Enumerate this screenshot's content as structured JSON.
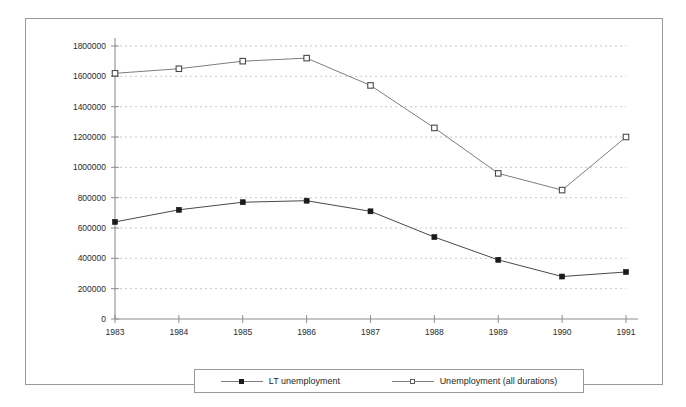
{
  "chart_data": {
    "type": "line",
    "title": "",
    "xlabel": "",
    "ylabel": "",
    "categories": [
      "1983",
      "1984",
      "1985",
      "1986",
      "1987",
      "1988",
      "1989",
      "1990",
      "1991"
    ],
    "ylim": [
      0,
      1800000
    ],
    "ytick_step": 200000,
    "yticks": [
      "0",
      "200000",
      "400000",
      "600000",
      "800000",
      "1000000",
      "1200000",
      "1400000",
      "1600000",
      "1800000"
    ],
    "grid": true,
    "legend_position": "bottom",
    "series": [
      {
        "name": "LT unemployment",
        "marker": "filled-square",
        "color": "#1a1a1a",
        "values": [
          640000,
          720000,
          770000,
          780000,
          710000,
          540000,
          390000,
          280000,
          310000
        ]
      },
      {
        "name": "Unemployment (all durations)",
        "marker": "open-square",
        "color": "#7d7d7d",
        "values": [
          1620000,
          1650000,
          1700000,
          1720000,
          1540000,
          1260000,
          960000,
          850000,
          1200000
        ]
      }
    ]
  },
  "legend": {
    "entries": [
      {
        "label": "LT unemployment"
      },
      {
        "label": "Unemployment (all durations)"
      }
    ]
  }
}
